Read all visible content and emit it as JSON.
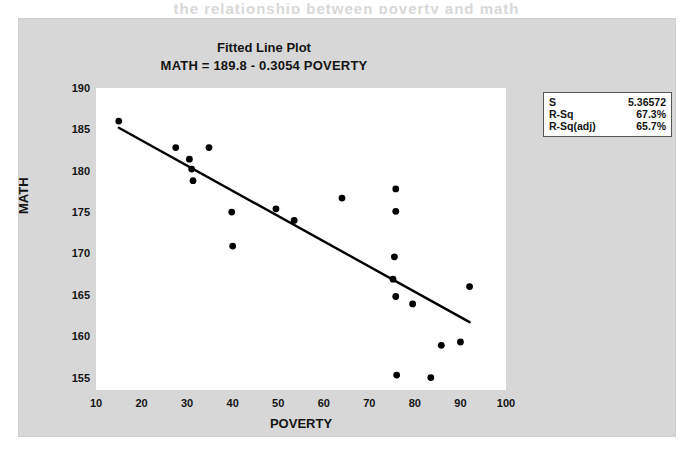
{
  "page": {
    "bleed_text": "the relationship between poverty and math"
  },
  "chart_data": {
    "type": "scatter",
    "title": "Fitted Line Plot",
    "subtitle": "MATH = 189.8 - 0.3054 POVERTY",
    "xlabel": "POVERTY",
    "ylabel": "MATH",
    "xlim": [
      10,
      100
    ],
    "ylim": [
      153.5,
      190
    ],
    "xticks": [
      10,
      20,
      30,
      40,
      50,
      60,
      70,
      80,
      90,
      100
    ],
    "yticks": [
      155,
      160,
      165,
      170,
      175,
      180,
      185,
      190
    ],
    "grid": false,
    "legend_position": "outside-top-right",
    "marker_color": "#000000",
    "line_color": "#000000",
    "points": [
      {
        "x": 15.0,
        "y": 186.0
      },
      {
        "x": 27.5,
        "y": 182.8
      },
      {
        "x": 30.5,
        "y": 181.4
      },
      {
        "x": 31.0,
        "y": 180.2
      },
      {
        "x": 31.3,
        "y": 178.8
      },
      {
        "x": 34.8,
        "y": 182.8
      },
      {
        "x": 39.8,
        "y": 175.0
      },
      {
        "x": 40.0,
        "y": 170.9
      },
      {
        "x": 49.5,
        "y": 175.4
      },
      {
        "x": 53.5,
        "y": 174.0
      },
      {
        "x": 64.0,
        "y": 176.7
      },
      {
        "x": 75.8,
        "y": 177.8
      },
      {
        "x": 75.8,
        "y": 175.1
      },
      {
        "x": 75.5,
        "y": 169.6
      },
      {
        "x": 75.2,
        "y": 166.9
      },
      {
        "x": 75.8,
        "y": 164.8
      },
      {
        "x": 76.0,
        "y": 155.3
      },
      {
        "x": 79.5,
        "y": 163.9
      },
      {
        "x": 83.5,
        "y": 155.0
      },
      {
        "x": 85.8,
        "y": 158.9
      },
      {
        "x": 90.0,
        "y": 159.3
      },
      {
        "x": 92.0,
        "y": 166.0
      }
    ],
    "fit_line": {
      "intercept": 189.8,
      "slope": -0.3054,
      "x_start": 15.0,
      "x_end": 92.0,
      "y_start": 185.2,
      "y_end": 161.7
    },
    "stats": [
      {
        "label": "S",
        "value": "5.36572"
      },
      {
        "label": "R-Sq",
        "value": "67.3%"
      },
      {
        "label": "R-Sq(adj)",
        "value": "65.7%"
      }
    ]
  }
}
